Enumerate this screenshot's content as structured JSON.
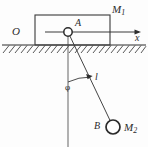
{
  "figure": {
    "kind": "physics-diagram",
    "width": 148,
    "height": 147,
    "background_color": "#fdfdfd",
    "stroke_color": "#333333",
    "labels": {
      "block_mass": "M",
      "block_mass_sub": "1",
      "pivot_point": "A",
      "origin": "O",
      "axis_x": "x",
      "angle": "φ",
      "rod_length": "l",
      "bob_point": "B",
      "bob_mass": "M",
      "bob_mass_sub": "2"
    },
    "geometry": {
      "block": {
        "x": 35,
        "y": 15,
        "width": 75,
        "height": 30
      },
      "ground_line_y": 45,
      "ground_x_start": 2,
      "ground_x_end": 146,
      "pivot": {
        "cx": 68,
        "cy": 32,
        "r": 4.2
      },
      "axis_arrow": {
        "x1": 45,
        "y1": 32,
        "x2": 141,
        "y2": 32
      },
      "vertical_reference": {
        "x": 68,
        "y1": 32,
        "y2": 147
      },
      "rod": {
        "x1": 68,
        "y1": 32,
        "x2": 113,
        "y2": 126
      },
      "bob": {
        "cx": 113,
        "cy": 127,
        "r": 7
      },
      "angle_arc": {
        "cx": 68,
        "cy": 32,
        "radius": 50,
        "from_deg": 90,
        "to_deg": 64
      },
      "angle_value_deg": 26
    }
  }
}
